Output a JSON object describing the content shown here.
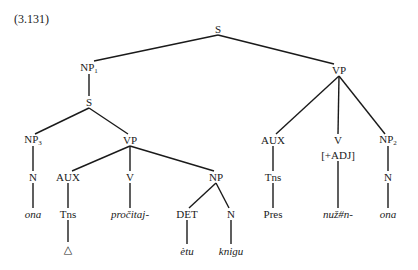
{
  "example_number": "(3.131)",
  "nodes": [
    {
      "id": "s_root",
      "label": "S",
      "x": 218,
      "y": 29
    },
    {
      "id": "np1",
      "label": "NP",
      "sub": "1",
      "x": 89,
      "y": 68
    },
    {
      "id": "vp_main",
      "label": "VP",
      "x": 339,
      "y": 70
    },
    {
      "id": "s_emb",
      "label": "S",
      "x": 89,
      "y": 102
    },
    {
      "id": "np3",
      "label": "NP",
      "sub": "3",
      "x": 33,
      "y": 140
    },
    {
      "id": "vp_emb",
      "label": "VP",
      "x": 130,
      "y": 140
    },
    {
      "id": "n_left",
      "label": "N",
      "x": 33,
      "y": 177
    },
    {
      "id": "aux_left",
      "label": "AUX",
      "x": 68,
      "y": 177
    },
    {
      "id": "v_left",
      "label": "V",
      "x": 130,
      "y": 177
    },
    {
      "id": "np_obj",
      "label": "NP",
      "x": 216,
      "y": 177
    },
    {
      "id": "ona_left",
      "label": "ona",
      "italic": true,
      "x": 33,
      "y": 214
    },
    {
      "id": "tns_left",
      "label": "Tns",
      "x": 68,
      "y": 214
    },
    {
      "id": "procitaj",
      "label": "pročitaj-",
      "italic": true,
      "x": 130,
      "y": 214
    },
    {
      "id": "det",
      "label": "DET",
      "x": 187,
      "y": 214
    },
    {
      "id": "n_obj",
      "label": "N",
      "x": 231,
      "y": 214
    },
    {
      "id": "delta",
      "label": "△",
      "x": 68,
      "y": 249
    },
    {
      "id": "etu",
      "label": "ètu",
      "italic": true,
      "x": 187,
      "y": 251
    },
    {
      "id": "knigu",
      "label": "knigu",
      "italic": true,
      "x": 231,
      "y": 251
    },
    {
      "id": "aux_right",
      "label": "AUX",
      "x": 273,
      "y": 140
    },
    {
      "id": "v_right",
      "label": "V",
      "x": 338,
      "y": 140
    },
    {
      "id": "adj_feature",
      "label": "[+ADJ]",
      "x": 338,
      "y": 155
    },
    {
      "id": "np2",
      "label": "NP",
      "sub": "2",
      "x": 388,
      "y": 140
    },
    {
      "id": "tns_right",
      "label": "Tns",
      "x": 273,
      "y": 177
    },
    {
      "id": "n_right",
      "label": "N",
      "x": 388,
      "y": 177
    },
    {
      "id": "pres",
      "label": "Pres",
      "x": 273,
      "y": 214
    },
    {
      "id": "nuzn",
      "label": "nuž#n-",
      "italic": true,
      "x": 338,
      "y": 214
    },
    {
      "id": "ona_right",
      "label": "ona",
      "italic": true,
      "x": 388,
      "y": 214
    }
  ],
  "edges": [
    [
      218,
      35,
      94,
      61
    ],
    [
      218,
      35,
      334,
      64
    ],
    [
      89,
      74,
      89,
      96
    ],
    [
      89,
      108,
      35,
      134
    ],
    [
      89,
      108,
      128,
      134
    ],
    [
      33,
      146,
      33,
      171
    ],
    [
      130,
      146,
      72,
      171
    ],
    [
      130,
      146,
      130,
      171
    ],
    [
      130,
      146,
      214,
      171
    ],
    [
      33,
      183,
      33,
      208
    ],
    [
      68,
      183,
      68,
      208
    ],
    [
      130,
      183,
      130,
      208
    ],
    [
      216,
      183,
      189,
      208
    ],
    [
      216,
      183,
      229,
      208
    ],
    [
      68,
      220,
      68,
      242
    ],
    [
      187,
      220,
      187,
      244
    ],
    [
      231,
      220,
      231,
      244
    ],
    [
      339,
      76,
      276,
      134
    ],
    [
      339,
      76,
      338,
      134
    ],
    [
      339,
      76,
      385,
      134
    ],
    [
      273,
      146,
      273,
      171
    ],
    [
      388,
      146,
      388,
      171
    ],
    [
      273,
      183,
      273,
      208
    ],
    [
      338,
      161,
      338,
      208
    ],
    [
      388,
      183,
      388,
      208
    ]
  ]
}
